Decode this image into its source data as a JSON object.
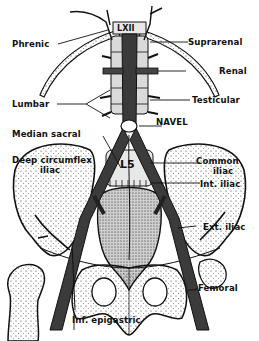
{
  "figure": {
    "colors": {
      "ink": "#111111",
      "vessel": "#2a2a2a",
      "bone_fill": "#f4f4f4",
      "background": "#ffffff"
    },
    "vertebra_labels": {
      "top": "LXII",
      "lower": "L5"
    },
    "labels": {
      "phrenic": "Phrenic",
      "suprarenal": "Suprarenal",
      "renal": "Renal",
      "lumbar": "Lumbar",
      "testicular": "Testicular",
      "median_sacral": "Median sacral",
      "navel": "NAVEL",
      "deep_circumflex_1": "Deep circumflex",
      "deep_circumflex_2": "iliac",
      "common_iliac_1": "Common",
      "common_iliac_2": "iliac",
      "int_iliac": "Int. iliac",
      "ext_iliac": "Ext. iliac",
      "femoral": "Femoral",
      "inf_epigastric": "Inf. epigastric"
    }
  }
}
